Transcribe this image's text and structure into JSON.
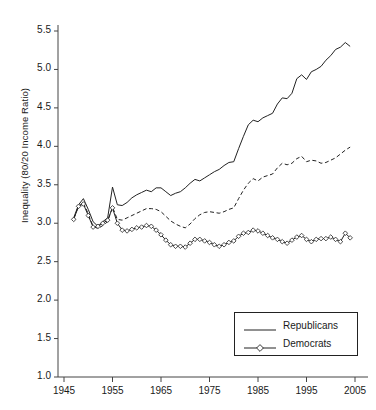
{
  "chart_data": {
    "type": "line",
    "title": "",
    "xlabel": "",
    "ylabel": "Inequality (80/20 Income Ratio)",
    "xlim": [
      1945,
      2006
    ],
    "ylim": [
      1.0,
      5.6
    ],
    "yticks": [
      "1.0",
      "1.5",
      "2.0",
      "2.5",
      "3.0",
      "3.5",
      "4.0",
      "4.5",
      "5.0",
      "5.5"
    ],
    "ytick_values": [
      1.0,
      1.5,
      2.0,
      2.5,
      3.0,
      3.5,
      4.0,
      4.5,
      5.0,
      5.5
    ],
    "xticks": [
      "1945",
      "1955",
      "1965",
      "1975",
      "1985",
      "1995",
      "2005"
    ],
    "xtick_values": [
      1945,
      1955,
      1965,
      1975,
      1985,
      1995,
      2005
    ],
    "grid": false,
    "legend_position": "bottom-right",
    "legend": [
      "Republicans",
      "Democrats"
    ],
    "series": [
      {
        "name": "Republicans",
        "style": "solid",
        "marker": "none",
        "color": "#222222",
        "x": [
          1947,
          1948,
          1949,
          1950,
          1951,
          1952,
          1953,
          1954,
          1955,
          1956,
          1957,
          1958,
          1959,
          1960,
          1961,
          1962,
          1963,
          1964,
          1965,
          1966,
          1967,
          1968,
          1969,
          1970,
          1971,
          1972,
          1973,
          1974,
          1975,
          1976,
          1977,
          1978,
          1979,
          1980,
          1981,
          1982,
          1983,
          1984,
          1985,
          1986,
          1987,
          1988,
          1989,
          1990,
          1991,
          1992,
          1993,
          1994,
          1995,
          1996,
          1997,
          1998,
          1999,
          2000,
          2001,
          2002,
          2003,
          2004
        ],
        "y": [
          3.07,
          3.24,
          3.32,
          3.18,
          3.02,
          2.96,
          3.02,
          3.07,
          3.47,
          3.24,
          3.23,
          3.27,
          3.33,
          3.37,
          3.4,
          3.43,
          3.41,
          3.46,
          3.46,
          3.41,
          3.36,
          3.39,
          3.41,
          3.46,
          3.52,
          3.57,
          3.55,
          3.59,
          3.63,
          3.67,
          3.7,
          3.75,
          3.79,
          3.8,
          3.97,
          4.13,
          4.28,
          4.34,
          4.32,
          4.37,
          4.4,
          4.43,
          4.55,
          4.63,
          4.62,
          4.69,
          4.88,
          4.93,
          4.87,
          4.97,
          5.0,
          5.04,
          5.12,
          5.18,
          5.26,
          5.29,
          5.35,
          5.3
        ]
      },
      {
        "name": "Middle (unlabeled dashed series)",
        "style": "dashed",
        "marker": "none",
        "color": "#222222",
        "x": [
          1947,
          1948,
          1949,
          1950,
          1951,
          1952,
          1953,
          1954,
          1955,
          1956,
          1957,
          1958,
          1959,
          1960,
          1961,
          1962,
          1963,
          1964,
          1965,
          1966,
          1967,
          1968,
          1969,
          1970,
          1971,
          1972,
          1973,
          1974,
          1975,
          1976,
          1977,
          1978,
          1979,
          1980,
          1981,
          1982,
          1983,
          1984,
          1985,
          1986,
          1987,
          1988,
          1989,
          1990,
          1991,
          1992,
          1993,
          1994,
          1995,
          1996,
          1997,
          1998,
          1999,
          2000,
          2001,
          2002,
          2003,
          2004
        ],
        "y": [
          3.06,
          3.22,
          3.27,
          3.12,
          2.96,
          2.93,
          2.97,
          3.02,
          3.21,
          3.05,
          3.04,
          3.07,
          3.1,
          3.13,
          3.16,
          3.19,
          3.19,
          3.18,
          3.15,
          3.09,
          3.03,
          2.99,
          2.96,
          2.94,
          2.99,
          3.06,
          3.11,
          3.14,
          3.15,
          3.14,
          3.13,
          3.15,
          3.18,
          3.2,
          3.32,
          3.43,
          3.52,
          3.58,
          3.55,
          3.6,
          3.62,
          3.64,
          3.72,
          3.78,
          3.76,
          3.78,
          3.84,
          3.87,
          3.8,
          3.82,
          3.81,
          3.78,
          3.79,
          3.82,
          3.85,
          3.9,
          3.95,
          3.99
        ]
      },
      {
        "name": "Democrats",
        "style": "solid",
        "marker": "diamond",
        "color": "#222222",
        "x": [
          1947,
          1948,
          1949,
          1950,
          1951,
          1952,
          1953,
          1954,
          1955,
          1956,
          1957,
          1958,
          1959,
          1960,
          1961,
          1962,
          1963,
          1964,
          1965,
          1966,
          1967,
          1968,
          1969,
          1970,
          1971,
          1972,
          1973,
          1974,
          1975,
          1976,
          1977,
          1978,
          1979,
          1980,
          1981,
          1982,
          1983,
          1984,
          1985,
          1986,
          1987,
          1988,
          1989,
          1990,
          1991,
          1992,
          1993,
          1994,
          1995,
          1996,
          1997,
          1998,
          1999,
          2000,
          2001,
          2002,
          2003,
          2004
        ],
        "y": [
          3.05,
          3.22,
          3.25,
          3.1,
          2.95,
          2.96,
          3.0,
          3.04,
          3.2,
          3.0,
          2.91,
          2.9,
          2.92,
          2.94,
          2.95,
          2.97,
          2.96,
          2.91,
          2.85,
          2.78,
          2.72,
          2.7,
          2.7,
          2.69,
          2.74,
          2.79,
          2.79,
          2.77,
          2.75,
          2.72,
          2.7,
          2.72,
          2.75,
          2.77,
          2.83,
          2.87,
          2.88,
          2.91,
          2.9,
          2.87,
          2.84,
          2.81,
          2.79,
          2.76,
          2.74,
          2.78,
          2.82,
          2.84,
          2.79,
          2.76,
          2.79,
          2.8,
          2.8,
          2.82,
          2.79,
          2.76,
          2.87,
          2.81
        ]
      }
    ]
  },
  "axis": {
    "ylabel": "Inequality (80/20 Income Ratio)"
  },
  "legend": {
    "republicans_label": "Republicans",
    "democrats_label": "Democrats"
  }
}
